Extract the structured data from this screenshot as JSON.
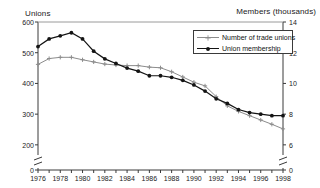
{
  "chart_data": {
    "type": "line",
    "title": "",
    "xlabel": "",
    "ylabel": "Unions",
    "y2label": "Members (thousands)",
    "x": [
      1976,
      1977,
      1978,
      1979,
      1980,
      1981,
      1982,
      1983,
      1984,
      1985,
      1986,
      1987,
      1988,
      1989,
      1990,
      1991,
      1992,
      1993,
      1994,
      1995,
      1996,
      1997,
      1998
    ],
    "xlim": [
      1976,
      1998
    ],
    "xticks": [
      1976,
      1977,
      1978,
      1979,
      1980,
      1981,
      1982,
      1983,
      1984,
      1985,
      1986,
      1987,
      1988,
      1989,
      1990,
      1991,
      1992,
      1993,
      1994,
      1995,
      1996,
      1997,
      1998
    ],
    "xticklabels": [
      "1976",
      "",
      "1978",
      "",
      "1980",
      "",
      "1982",
      "",
      "1984",
      "",
      "1986",
      "",
      "1988",
      "",
      "1990",
      "",
      "1992",
      "",
      "1994",
      "",
      "1996",
      "",
      "1998"
    ],
    "ylim": [
      180,
      600
    ],
    "yticks": [
      200,
      300,
      400,
      500,
      600
    ],
    "yticklabels": [
      "200",
      "300",
      "400",
      "500",
      "600"
    ],
    "y_axis_break": true,
    "y_zero_label": "0",
    "y2lim": [
      5.6,
      14
    ],
    "y2ticks": [
      6,
      8,
      10,
      12,
      14
    ],
    "y2ticklabels": [
      "6",
      "8",
      "10",
      "12",
      "14"
    ],
    "y2_axis_break": true,
    "y2_zero_label": "0",
    "grid": false,
    "legend_position": "upper right",
    "series": [
      {
        "name": "Number of trade unions",
        "axis": "left",
        "color": "#8c8c8c",
        "marker": "plus-dot",
        "values": [
          462,
          481,
          485,
          485,
          477,
          470,
          463,
          460,
          458,
          458,
          453,
          451,
          438,
          421,
          404,
          392,
          357,
          327,
          309,
          295,
          281,
          267,
          252
        ]
      },
      {
        "name": "Union membership",
        "axis": "right",
        "color": "#141414",
        "marker": "filled-circle",
        "values": [
          12.4,
          12.9,
          13.1,
          13.3,
          12.9,
          12.1,
          11.6,
          11.3,
          11.0,
          10.8,
          10.5,
          10.5,
          10.4,
          10.2,
          9.9,
          9.5,
          9.0,
          8.7,
          8.3,
          8.1,
          8.0,
          7.9,
          7.9
        ]
      }
    ]
  },
  "axis_titles": {
    "left": "Unions",
    "right": "Members (thousands)"
  },
  "legend": {
    "items": [
      {
        "label": "Number of trade unions",
        "color": "#8c8c8c",
        "marker": "plus-dot"
      },
      {
        "label": "Union membership",
        "color": "#141414",
        "marker": "filled-circle"
      }
    ]
  },
  "colors": {
    "unions_line": "#8c8c8c",
    "membership_line": "#141414",
    "axis": "#3a3a3a",
    "text": "#1a1a1a",
    "background": "#ffffff"
  }
}
